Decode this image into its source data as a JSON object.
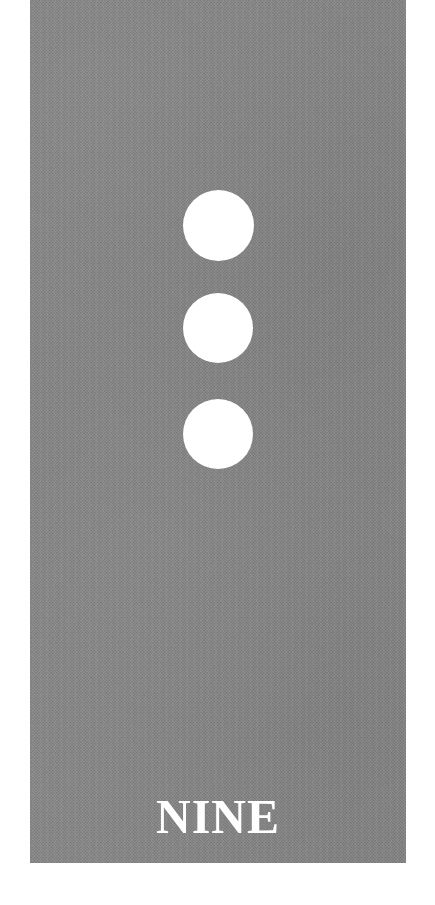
{
  "card": {
    "kind": "number-flash-card",
    "caption": "NINE",
    "number_value": "3",
    "dot_count": 3,
    "background_color": "#808080",
    "dot_color": "#ffffff",
    "caption_color": "#ffffff",
    "page_background_color": "#ffffff",
    "texture": "paper-grain",
    "dots": [
      {
        "label": "dot-1"
      },
      {
        "label": "dot-2"
      },
      {
        "label": "dot-3"
      }
    ]
  }
}
